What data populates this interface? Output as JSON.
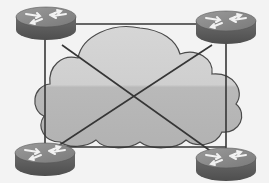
{
  "diagram": {
    "type": "network-topology",
    "topology": "full-mesh",
    "colors": {
      "background": "#f3f3f3",
      "cloud_fill_light": "#d2d2d2",
      "cloud_fill_dark": "#b4b4b4",
      "cloud_stroke": "#555555",
      "link": "#3a3a3a",
      "router_top": "#8a8a8a",
      "router_side": "#5e5e5e",
      "router_arrows": "#f0f0f0"
    },
    "cloud": {
      "label": ""
    },
    "nodes": [
      {
        "id": "router-top-left",
        "kind": "router",
        "icon": "router-icon",
        "cx": 46,
        "cy": 17
      },
      {
        "id": "router-top-right",
        "kind": "router",
        "icon": "router-icon",
        "cx": 226,
        "cy": 21
      },
      {
        "id": "router-bottom-left",
        "kind": "router",
        "icon": "router-icon",
        "cx": 45,
        "cy": 153
      },
      {
        "id": "router-bottom-right",
        "kind": "router",
        "icon": "router-icon",
        "cx": 226,
        "cy": 158
      }
    ],
    "links": [
      {
        "from": "router-top-left",
        "to": "router-top-right"
      },
      {
        "from": "router-top-left",
        "to": "router-bottom-left"
      },
      {
        "from": "router-top-right",
        "to": "router-bottom-right"
      },
      {
        "from": "router-bottom-left",
        "to": "router-bottom-right"
      },
      {
        "from": "router-top-left",
        "to": "router-bottom-right"
      },
      {
        "from": "router-top-right",
        "to": "router-bottom-left"
      }
    ]
  }
}
